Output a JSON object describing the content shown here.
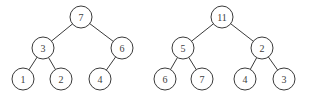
{
  "figure": {
    "background_color": "#ffffff",
    "node_stroke_color": "#3a3a3a",
    "node_fill_color": "#ffffff",
    "label_color": "#404040",
    "edge_color": "#3a3a3a",
    "node_radius": 11
  },
  "trees": [
    {
      "name": "left-tree",
      "root_value": "7",
      "nodes": [
        {
          "id": "L7",
          "label": "7",
          "cx": 81,
          "cy": 17,
          "level": 0
        },
        {
          "id": "L3",
          "label": "3",
          "cx": 43,
          "cy": 48,
          "level": 1
        },
        {
          "id": "L6",
          "label": "6",
          "cx": 122,
          "cy": 48,
          "level": 1
        },
        {
          "id": "L1",
          "label": "1",
          "cx": 23,
          "cy": 79,
          "level": 2
        },
        {
          "id": "L2",
          "label": "2",
          "cx": 61,
          "cy": 79,
          "level": 2
        },
        {
          "id": "L4",
          "label": "4",
          "cx": 100,
          "cy": 79,
          "level": 2
        }
      ],
      "edges": [
        {
          "from": "L7",
          "to": "L3"
        },
        {
          "from": "L7",
          "to": "L6"
        },
        {
          "from": "L3",
          "to": "L1"
        },
        {
          "from": "L3",
          "to": "L2"
        },
        {
          "from": "L6",
          "to": "L4"
        }
      ]
    },
    {
      "name": "right-tree",
      "root_value": "11",
      "nodes": [
        {
          "id": "R11",
          "label": "11",
          "cx": 222,
          "cy": 17,
          "level": 0
        },
        {
          "id": "R5",
          "label": "5",
          "cx": 183,
          "cy": 48,
          "level": 1
        },
        {
          "id": "R2",
          "label": "2",
          "cx": 262,
          "cy": 48,
          "level": 1
        },
        {
          "id": "R6",
          "label": "6",
          "cx": 165,
          "cy": 79,
          "level": 2
        },
        {
          "id": "R7",
          "label": "7",
          "cx": 202,
          "cy": 79,
          "level": 2
        },
        {
          "id": "R4",
          "label": "4",
          "cx": 245,
          "cy": 79,
          "level": 2
        },
        {
          "id": "R3",
          "label": "3",
          "cx": 284,
          "cy": 79,
          "level": 2
        }
      ],
      "edges": [
        {
          "from": "R11",
          "to": "R5"
        },
        {
          "from": "R11",
          "to": "R2"
        },
        {
          "from": "R5",
          "to": "R6"
        },
        {
          "from": "R5",
          "to": "R7"
        },
        {
          "from": "R2",
          "to": "R4"
        },
        {
          "from": "R2",
          "to": "R3"
        }
      ]
    }
  ]
}
